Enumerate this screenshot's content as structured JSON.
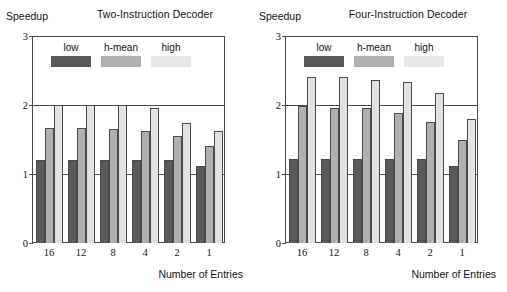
{
  "figure": {
    "panels": [
      {
        "key": "two",
        "title": "Two-Instruction Decoder",
        "ylabel": "Speedup",
        "xlabel": "Number of Entries"
      },
      {
        "key": "four",
        "title": "Four-Instruction Decoder",
        "ylabel": "Speedup",
        "xlabel": "Number of Entries"
      }
    ],
    "legend": {
      "items": [
        {
          "label": "low",
          "key": "low",
          "color": "#595959"
        },
        {
          "label": "h-mean",
          "key": "hmean",
          "color": "#b0b0b0"
        },
        {
          "label": "high",
          "key": "high",
          "color": "#e8e8e8"
        }
      ]
    },
    "yticks": [
      "3",
      "2",
      "1",
      "0"
    ]
  },
  "chart_data": [
    {
      "type": "bar",
      "title": "Two-Instruction Decoder",
      "xlabel": "Number of Entries",
      "ylabel": "Speedup",
      "ylim": [
        0,
        3
      ],
      "yticks": [
        0,
        1,
        2,
        3
      ],
      "grid": true,
      "legend_position": "inside-top-left",
      "categories": [
        "16",
        "12",
        "8",
        "4",
        "2",
        "1"
      ],
      "series": [
        {
          "name": "low",
          "values": [
            1.21,
            1.21,
            1.21,
            1.21,
            1.21,
            1.11
          ]
        },
        {
          "name": "h-mean",
          "values": [
            1.66,
            1.66,
            1.65,
            1.62,
            1.55,
            1.4
          ]
        },
        {
          "name": "high",
          "values": [
            2.0,
            2.0,
            2.0,
            1.96,
            1.74,
            1.63
          ]
        }
      ]
    },
    {
      "type": "bar",
      "title": "Four-Instruction Decoder",
      "xlabel": "Number of Entries",
      "ylabel": "Speedup",
      "ylim": [
        0,
        3
      ],
      "yticks": [
        0,
        1,
        2,
        3
      ],
      "grid": true,
      "legend_position": "inside-top-left",
      "categories": [
        "16",
        "12",
        "8",
        "4",
        "2",
        "1"
      ],
      "series": [
        {
          "name": "low",
          "values": [
            1.22,
            1.22,
            1.22,
            1.22,
            1.22,
            1.12
          ]
        },
        {
          "name": "h-mean",
          "values": [
            1.98,
            1.96,
            1.96,
            1.89,
            1.76,
            1.5
          ]
        },
        {
          "name": "high",
          "values": [
            2.4,
            2.4,
            2.36,
            2.34,
            2.17,
            1.8
          ]
        }
      ]
    }
  ]
}
